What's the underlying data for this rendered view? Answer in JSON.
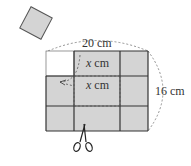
{
  "diagram": {
    "labels": {
      "width": "20 cm",
      "height": "16 cm",
      "cut_top": "x cm",
      "cut_side_var": "x",
      "cut_side_unit": " cm",
      "cut_top_var": "x",
      "cut_top_unit": " cm"
    },
    "sheet": {
      "width_cm": 20,
      "height_cm": 16,
      "fill": "#d4d4d4",
      "cut_corner_fill": "#ffffff",
      "line_color": "#333333",
      "dashed_color": "#555555"
    },
    "cut_square": {
      "fill": "#d4d4d4",
      "rotation_deg": 25
    }
  }
}
